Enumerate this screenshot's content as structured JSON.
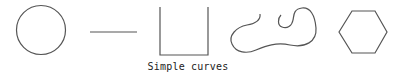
{
  "figure": {
    "caption": "Simple curves",
    "stroke_color": "#555555",
    "shapes": [
      {
        "name": "circle",
        "type": "closed"
      },
      {
        "name": "line-segment",
        "type": "open"
      },
      {
        "name": "open-rectangle",
        "type": "open"
      },
      {
        "name": "free-curve",
        "type": "open"
      },
      {
        "name": "hexagon",
        "type": "closed"
      }
    ]
  }
}
